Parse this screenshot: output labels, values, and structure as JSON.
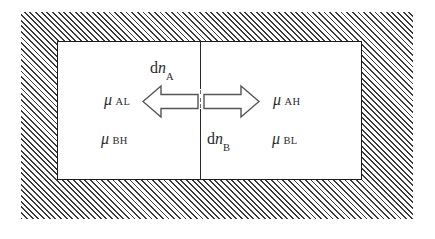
{
  "figure": {
    "type": "thermodynamic-partition-diagram",
    "canvas": {
      "width": 435,
      "height": 239,
      "background": "#ffffff"
    },
    "outer_region": {
      "name": "insulated-wall",
      "fill": "diagonal-hatch",
      "hatch_angle_deg": 45,
      "hatch_color": "#3b3b3b",
      "bounds": {
        "x": 21,
        "y": 12,
        "width": 392,
        "height": 207
      }
    },
    "chamber": {
      "name": "rigid-container",
      "border_color": "#1c1c1c",
      "fill": "#ffffff",
      "bounds": {
        "x": 57,
        "y": 41,
        "width": 305,
        "height": 139
      }
    },
    "partition": {
      "name": "central-partition",
      "orientation": "vertical",
      "x": 200,
      "gap_description": "broken dashed segment at mid-height"
    }
  },
  "arrows": [
    {
      "id": "arrow-left",
      "direction": "left",
      "style": "block-outline",
      "fill": "#ffffff",
      "stroke": "#555555",
      "meaning": "transfer of dn_A from high-mu side to low-mu side"
    },
    {
      "id": "arrow-right",
      "direction": "right",
      "style": "block-outline",
      "fill": "#ffffff",
      "stroke": "#555555",
      "meaning": "transfer of dn_B from high-mu side to low-mu side"
    }
  ],
  "labels": {
    "dn_a": {
      "base": "d",
      "variable": "n",
      "subscript": "A"
    },
    "dn_b": {
      "base": "d",
      "variable": "n",
      "subscript": "B"
    },
    "mu_al": {
      "symbol": "μ",
      "subscript": "AL"
    },
    "mu_ah": {
      "symbol": "μ",
      "subscript": "AH"
    },
    "mu_bh": {
      "symbol": "μ",
      "subscript": "BH"
    },
    "mu_bl": {
      "symbol": "μ",
      "subscript": "BL"
    }
  }
}
